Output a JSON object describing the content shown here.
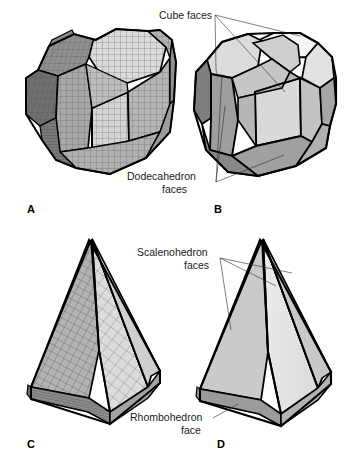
{
  "figure": {
    "background_color": "#ffffff",
    "outline_color": "#000000"
  },
  "panels": [
    {
      "id": "A",
      "letter": "A",
      "shape_name": "truncated-polyhedron-with-grid",
      "description": "Gridded (meshed) truncated cube / dodecahedron composite form"
    },
    {
      "id": "B",
      "letter": "B",
      "shape_name": "cube-dodecahedron-composite",
      "description": "Smooth shaded truncated cube / dodecahedron composite form"
    },
    {
      "id": "C",
      "letter": "C",
      "shape_name": "scalenohedron-pyramid-with-grid",
      "description": "Gridded (meshed) scalenohedron on rhombohedron base"
    },
    {
      "id": "D",
      "letter": "D",
      "shape_name": "scalenohedron-pyramid",
      "description": "Smooth shaded scalenohedron on rhombohedron base"
    }
  ],
  "callouts": [
    {
      "id": "cube-faces",
      "text": "Cube faces",
      "lines": [
        "Cube faces"
      ],
      "panel": "B"
    },
    {
      "id": "dodecahedron-faces",
      "text": "Dodecahedron faces",
      "lines": [
        "Dodecahedron",
        "faces"
      ],
      "panel": "B"
    },
    {
      "id": "scalenohedron-faces",
      "text": "Scalenohedron faces",
      "lines": [
        "Scalenohedron",
        "faces"
      ],
      "panel": "D"
    },
    {
      "id": "rhombohedron-face",
      "text": "Rhombohedron face",
      "lines": [
        "Rhombohedron",
        "face"
      ],
      "panel": "D"
    }
  ],
  "colors": {
    "background": "#ffffff",
    "outline": "#000000",
    "face_light": "#e6e6e6",
    "face_mid": "#cfcfcf",
    "face_medium": "#b8b8b8",
    "face_dark": "#9a9a9a",
    "face_darker": "#7d7d7d",
    "grid": "#4a4a4a",
    "leader": "#2b2b2b",
    "text": "#1a1a1a"
  }
}
